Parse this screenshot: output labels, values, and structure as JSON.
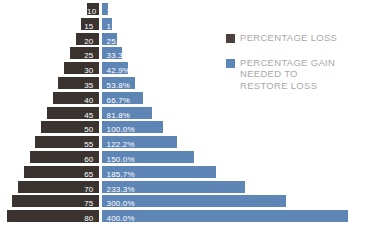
{
  "chart_data": {
    "type": "bar",
    "title": "",
    "subtitle": "",
    "xlabel": "",
    "ylabel": "",
    "orientation": "horizontal-diverging",
    "grid": false,
    "legend_position": "right",
    "categories": [
      "10",
      "15",
      "20",
      "25",
      "30",
      "35",
      "40",
      "45",
      "50",
      "55",
      "60",
      "65",
      "70",
      "75",
      "80"
    ],
    "series": [
      {
        "name": "PERCENTAGE LOSS",
        "color": "#3a3330",
        "direction": "left",
        "values": [
          10,
          15,
          20,
          25,
          30,
          35,
          40,
          45,
          50,
          55,
          60,
          65,
          70,
          75,
          80
        ],
        "labels": [
          "10",
          "15",
          "20",
          "25",
          "30",
          "35",
          "40",
          "45",
          "50",
          "55",
          "60",
          "65",
          "70",
          "75",
          "80"
        ]
      },
      {
        "name": "PERCENTAGE GAIN NEEDED TO RESTORE LOSS",
        "color": "#5d85b5",
        "direction": "right",
        "values": [
          11.1,
          17.6,
          25.0,
          33.3,
          42.9,
          53.8,
          66.7,
          81.8,
          100.0,
          122.2,
          150.0,
          185.7,
          233.3,
          300.0,
          400.0
        ],
        "labels": [
          "11.1%",
          "17.6%",
          "25.0%",
          "33.3%",
          "42.9%",
          "53.8%",
          "66.7%",
          "81.8%",
          "100.0%",
          "122.2%",
          "150.0%",
          "185.7%",
          "233.3%",
          "300.0%",
          "400.0%"
        ]
      }
    ]
  },
  "legend": {
    "items": [
      {
        "swatch": "loss",
        "lines": [
          "PERCENTAGE LOSS"
        ]
      },
      {
        "swatch": "gain",
        "lines": [
          "PERCENTAGE GAIN",
          "NEEDED TO",
          "RESTORE LOSS"
        ]
      }
    ]
  },
  "layout": {
    "center_x": 98.5,
    "row_top": 3,
    "row_pitch": 14.8,
    "row_height": 12,
    "gap": 3,
    "loss_px_per_unit": 1.15,
    "gain_px_per_unit": 0.615
  }
}
